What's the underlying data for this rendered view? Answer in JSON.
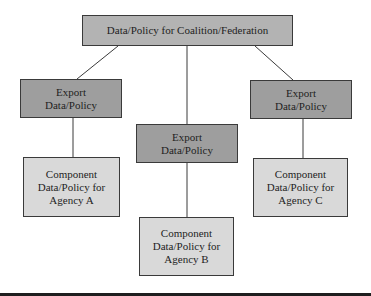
{
  "diagram": {
    "type": "hierarchy",
    "root": {
      "label": "Data/Policy for Coalition/Federation",
      "fill": "#b3b3b3"
    },
    "exports": [
      {
        "line1": "Export",
        "line2": "Data/Policy",
        "fill": "#9e9e9e"
      },
      {
        "line1": "Export",
        "line2": "Data/Policy",
        "fill": "#9e9e9e"
      },
      {
        "line1": "Export",
        "line2": "Data/Policy",
        "fill": "#9e9e9e"
      }
    ],
    "components": [
      {
        "line1": "Component",
        "line2": "Data/Policy for",
        "line3": "Agency A",
        "fill": "#d9d9d9"
      },
      {
        "line1": "Component",
        "line2": "Data/Policy for",
        "line3": "Agency B",
        "fill": "#d9d9d9"
      },
      {
        "line1": "Component",
        "line2": "Data/Policy for",
        "line3": "Agency C",
        "fill": "#d9d9d9"
      }
    ],
    "edges": [
      {
        "from": "root",
        "to": "exports.0"
      },
      {
        "from": "root",
        "to": "exports.1"
      },
      {
        "from": "root",
        "to": "exports.2"
      },
      {
        "from": "exports.0",
        "to": "components.0"
      },
      {
        "from": "exports.1",
        "to": "components.1"
      },
      {
        "from": "exports.2",
        "to": "components.2"
      }
    ]
  }
}
